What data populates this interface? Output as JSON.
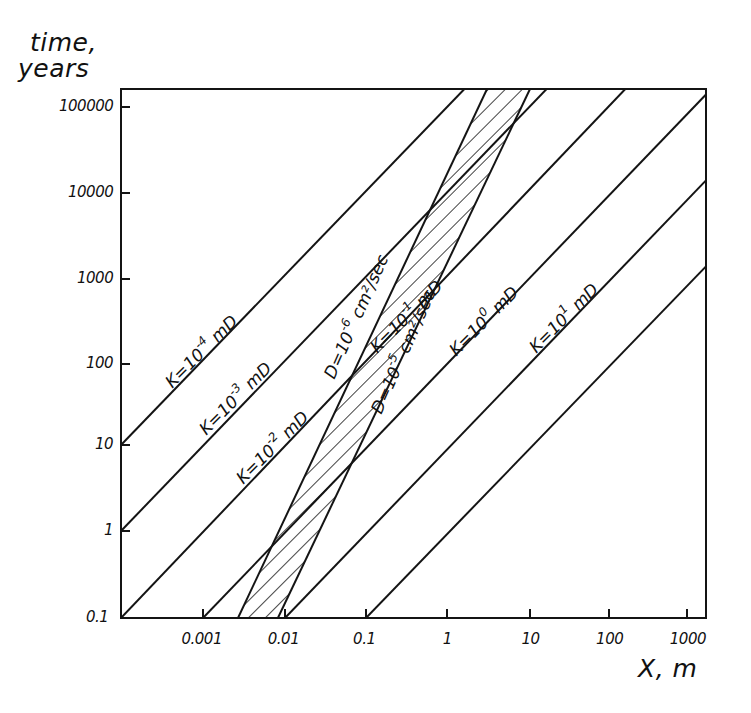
{
  "chart_data": {
    "type": "line",
    "title": "",
    "xlabel": "X, m",
    "ylabel": "time, years",
    "ylabel_lines": [
      "time,",
      "years"
    ],
    "xscale": "log",
    "yscale": "log",
    "xlim": [
      0.0001,
      1400
    ],
    "ylim": [
      0.1,
      162000
    ],
    "grid": false,
    "legend": "none (inline curve labels)",
    "x_ticks": [
      {
        "value": 0.001,
        "label": "0.001"
      },
      {
        "value": 0.01,
        "label": "0.01"
      },
      {
        "value": 0.1,
        "label": "0.1"
      },
      {
        "value": 1,
        "label": "1"
      },
      {
        "value": 10,
        "label": "10"
      },
      {
        "value": 100,
        "label": "100"
      },
      {
        "value": 1000,
        "label": "1000"
      }
    ],
    "y_ticks": [
      {
        "value": 0.1,
        "label": "0.1"
      },
      {
        "value": 1,
        "label": "1"
      },
      {
        "value": 10,
        "label": "10"
      },
      {
        "value": 100,
        "label": "100"
      },
      {
        "value": 1000,
        "label": "1000"
      },
      {
        "value": 10000,
        "label": "10000"
      },
      {
        "value": 100000,
        "label": "100000"
      }
    ],
    "series": [
      {
        "name": "K=10^-4 mD",
        "kind": "permeability",
        "label_base": "K=10",
        "label_exp": "-4",
        "label_unit": " mD",
        "points": [
          [
            0.0001,
            10
          ],
          [
            1.62,
            162000
          ]
        ]
      },
      {
        "name": "K=10^-3 mD",
        "kind": "permeability",
        "label_base": "K=10",
        "label_exp": "-3",
        "label_unit": " mD",
        "points": [
          [
            0.0001,
            1
          ],
          [
            16.2,
            162000
          ]
        ]
      },
      {
        "name": "K=10^-2 mD",
        "kind": "permeability",
        "label_base": "K=10",
        "label_exp": "-2",
        "label_unit": " mD",
        "points": [
          [
            0.0001,
            0.1
          ],
          [
            162,
            162000
          ]
        ]
      },
      {
        "name": "K=10^-1 mD",
        "kind": "permeability",
        "label_base": "K=10",
        "label_exp": "-1",
        "label_unit": " mD",
        "points": [
          [
            0.001,
            0.1
          ],
          [
            1400,
            140000
          ]
        ]
      },
      {
        "name": "K=10^0 mD",
        "kind": "permeability",
        "label_base": "K=10",
        "label_exp": "0",
        "label_unit": " mD",
        "points": [
          [
            0.01,
            0.1
          ],
          [
            1400,
            14000
          ]
        ]
      },
      {
        "name": "K=10^1 mD",
        "kind": "permeability",
        "label_base": "K=10",
        "label_exp": "1",
        "label_unit": " mD",
        "points": [
          [
            0.1,
            0.1
          ],
          [
            1400,
            1400
          ]
        ]
      },
      {
        "name": "D=10^-6 cm2/sec",
        "kind": "diffusion",
        "label_base": "D=10",
        "label_exp": "-6",
        "label_unit": " cm²/sec",
        "points": [
          [
            0.00267,
            0.1
          ],
          [
            3.03,
            162000
          ]
        ]
      },
      {
        "name": "D=10^-5 cm2/sec",
        "kind": "diffusion",
        "label_base": "D=10",
        "label_exp": "-5",
        "label_unit": " cm²/sec",
        "points": [
          [
            0.0082,
            0.1
          ],
          [
            10,
            162000
          ]
        ]
      }
    ],
    "shaded_band": {
      "between": [
        "D=10^-6 cm2/sec",
        "D=10^-5 cm2/sec"
      ],
      "fill": "diagonal hatch"
    },
    "annotations": [
      {
        "series": "K=10^-4 mD",
        "at": [
          0.00045,
          45
        ],
        "angle": -45
      },
      {
        "series": "K=10^-3 mD",
        "at": [
          0.0012,
          12
        ],
        "angle": -45
      },
      {
        "series": "K=10^-2 mD",
        "at": [
          0.0033,
          3.2
        ],
        "angle": -45
      },
      {
        "series": "K=10^-1 mD",
        "at": [
          0.15,
          120
        ],
        "angle": -45
      },
      {
        "series": "K=10^0 mD",
        "at": [
          1.4,
          110
        ],
        "angle": -45
      },
      {
        "series": "K=10^1 mD",
        "at": [
          13,
          120
        ],
        "angle": -45
      },
      {
        "series": "D=10^-6 cm2/sec",
        "at": [
          0.045,
          60
        ],
        "angle": -66
      },
      {
        "series": "D=10^-5 cm2/sec",
        "at": [
          0.17,
          22
        ],
        "angle": -66
      }
    ]
  },
  "style": {
    "ink": "#141414",
    "background": "#ffffff"
  }
}
